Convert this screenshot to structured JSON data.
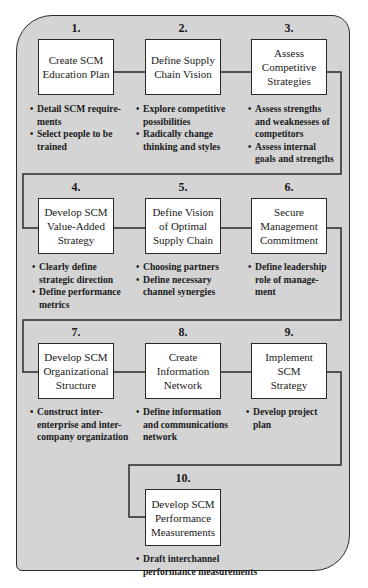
{
  "diagram": {
    "line_color": "#2a2a2a",
    "panel_color": "#d4d4d4",
    "box_color": "#ffffff",
    "steps": [
      {
        "number": "1.",
        "title": "Create SCM\nEducation Plan",
        "bullets": [
          "Detail SCM require-\nments",
          "Select people to be\ntrained"
        ]
      },
      {
        "number": "2.",
        "title": "Define Supply\nChain Vision",
        "bullets": [
          "Explore competitive\npossibilities",
          "Radically change\nthinking and styles"
        ]
      },
      {
        "number": "3.",
        "title": "Assess\nCompetitive\nStrategies",
        "bullets": [
          "Assess strengths\nand weaknesses of\ncompetitors",
          "Assess internal\ngoals and strengths"
        ]
      },
      {
        "number": "4.",
        "title": "Develop SCM\nValue-Added\nStrategy",
        "bullets": [
          "Clearly define\nstrategic direction",
          "Define performance\nmetrics"
        ]
      },
      {
        "number": "5.",
        "title": "Define Vision\nof Optimal\nSupply Chain",
        "bullets": [
          "Choosing partners",
          "Define necessary\nchannel synergies"
        ]
      },
      {
        "number": "6.",
        "title": "Secure\nManagement\nCommitment",
        "bullets": [
          "Define leadership\nrole of manage-\nment"
        ]
      },
      {
        "number": "7.",
        "title": "Develop SCM\nOrganizational\nStructure",
        "bullets": [
          "Construct inter-\nenterprise and inter-\ncompany organization"
        ]
      },
      {
        "number": "8.",
        "title": "Create\nInformation\nNetwork",
        "bullets": [
          "Define information\nand communications\nnetwork"
        ]
      },
      {
        "number": "9.",
        "title": "Implement\nSCM\nStrategy",
        "bullets": [
          "Develop project\nplan"
        ]
      },
      {
        "number": "10.",
        "title": "Develop SCM\nPerformance\nMeasurements",
        "bullets": [
          "Draft interchannel\nperformance measurements"
        ]
      }
    ]
  }
}
